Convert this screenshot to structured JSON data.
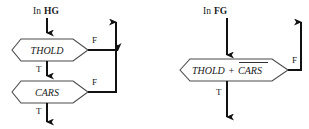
{
  "figure": {
    "type": "flowchart",
    "background_color": "#ffffff",
    "line_color": "#111111",
    "node_outline_color": "#4a4a4a",
    "text_color": "#1a1a1a"
  },
  "diagrams": [
    {
      "id": "left",
      "input_label": {
        "prefix": "In",
        "emphasis": "HG",
        "full": "In HG"
      },
      "nodes": [
        {
          "id": "thold",
          "label": "THOLD",
          "shape": "hexagon",
          "branches": [
            {
              "label": "T",
              "direction": "down"
            },
            {
              "label": "F",
              "direction": "right"
            }
          ]
        },
        {
          "id": "cars",
          "label": "CARS",
          "shape": "hexagon",
          "branches": [
            {
              "label": "T",
              "direction": "down"
            },
            {
              "label": "F",
              "direction": "right"
            }
          ]
        }
      ],
      "exits": [
        {
          "id": "false-exit-up",
          "label": "",
          "direction": "up"
        },
        {
          "id": "true-exit-down",
          "label": "",
          "direction": "down"
        }
      ]
    },
    {
      "id": "right",
      "input_label": {
        "prefix": "In",
        "emphasis": "FG",
        "full": "In FG"
      },
      "nodes": [
        {
          "id": "thold-plus-cars",
          "label": "THOLD + CARS",
          "label_parts": [
            {
              "text": "THOLD",
              "overline": false
            },
            {
              "text": "+",
              "overline": false
            },
            {
              "text": "CARS",
              "overline": true
            }
          ],
          "shape": "hexagon",
          "branches": [
            {
              "label": "T",
              "direction": "down"
            },
            {
              "label": "F",
              "direction": "right"
            }
          ]
        }
      ],
      "exits": [
        {
          "id": "false-exit-up",
          "label": "",
          "direction": "up"
        },
        {
          "id": "true-exit-down",
          "label": "",
          "direction": "down"
        }
      ]
    }
  ],
  "labels": {
    "true_branch": "T",
    "false_branch": "F",
    "in_prefix": "In",
    "left_gate": "HG",
    "right_gate": "FG",
    "node_thold": "THOLD",
    "node_cars": "CARS",
    "node_thold_part": "THOLD",
    "node_plus": "+",
    "node_cars_overlined": "CARS"
  }
}
